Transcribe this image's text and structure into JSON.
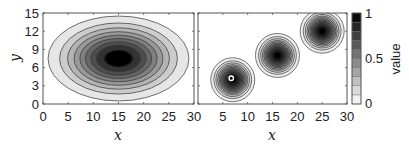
{
  "chart_data": [
    {
      "type": "heatmap",
      "subtype": "filled-contour",
      "title": "",
      "xlabel": "x",
      "ylabel": "y",
      "xlim": [
        0,
        30
      ],
      "ylim": [
        0,
        15
      ],
      "xticks": [
        0,
        5,
        10,
        15,
        20,
        25,
        30
      ],
      "yticks": [
        0,
        3,
        6,
        9,
        12,
        15
      ],
      "grid": false,
      "description": "Single elliptical Gaussian peak",
      "peaks": [
        {
          "cx": 15,
          "cy": 7.5,
          "rx": 14,
          "ry": 7,
          "peak_value": 1.0
        }
      ],
      "contour_levels": 10
    },
    {
      "type": "heatmap",
      "subtype": "filled-contour",
      "title": "",
      "xlabel": "x",
      "ylabel": "",
      "xlim": [
        0,
        30
      ],
      "ylim": [
        0,
        15
      ],
      "xticks": [
        0,
        5,
        10,
        15,
        20,
        25,
        30
      ],
      "yticks": [
        0,
        3,
        6,
        9,
        12,
        15
      ],
      "grid": false,
      "description": "Three circular Gaussian peaks along a diagonal; first peak has a small white ring marker at its center",
      "peaks": [
        {
          "cx": 7,
          "cy": 4,
          "r_px": 22,
          "peak_value": 1.0,
          "marker": "white-ring"
        },
        {
          "cx": 16,
          "cy": 8,
          "r_px": 22,
          "peak_value": 1.0
        },
        {
          "cx": 25,
          "cy": 12,
          "r_px": 22,
          "peak_value": 1.0
        }
      ],
      "contour_levels": 10
    }
  ],
  "colorbar": {
    "label": "value",
    "range": [
      0,
      1
    ],
    "ticks": [
      "0",
      "0.5",
      "1"
    ],
    "levels": 10,
    "colormap": "gray-reversed",
    "color_low": "#ffffff",
    "color_high": "#000000"
  },
  "left_plot": {
    "xlabel": "x",
    "ylabel": "y",
    "xtick_labels": [
      "0",
      "5",
      "10",
      "15",
      "20",
      "25",
      "30"
    ],
    "ytick_labels": [
      "0",
      "3",
      "6",
      "9",
      "12",
      "15"
    ]
  },
  "right_plot": {
    "xlabel": "x",
    "xtick_labels": [
      "5",
      "10",
      "15",
      "20",
      "25",
      "30"
    ]
  }
}
